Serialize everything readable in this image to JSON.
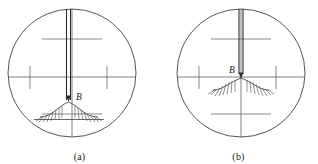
{
  "figure": {
    "panels": [
      {
        "id": "a",
        "caption": "(a)",
        "point_label": "B",
        "description": "Rod off-center: vertical crosshair not aligned with point B on the mound",
        "aligned": false
      },
      {
        "id": "b",
        "caption": "(b)",
        "point_label": "B",
        "description": "Rod centered: vertical crosshair bisects point B at the mound apex",
        "aligned": true
      }
    ]
  },
  "colors": {
    "line": "#3f3f3f",
    "circle": "#3f3f3f",
    "reticle": "#6b6b6b",
    "rod": "#2b2b2b",
    "ground": "#4a4a4a",
    "label": "#1a1a1a",
    "background": "#ffffff"
  },
  "geometry": {
    "panel_width": 159,
    "panel_height": 164,
    "circle_a": {
      "cx": 72,
      "cy": 73,
      "r": 64
    },
    "circle_b": {
      "cx": 82,
      "cy": 73,
      "r": 64
    }
  }
}
